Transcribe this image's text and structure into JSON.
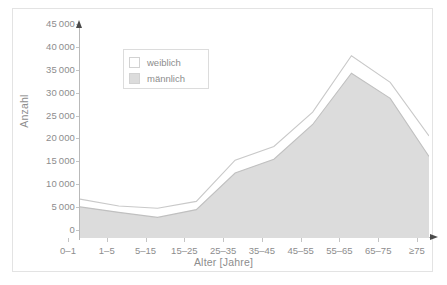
{
  "chart_data": {
    "type": "area",
    "title": "",
    "subtitle": "",
    "xlabel": "Alter [Jahre]",
    "ylabel": "Anzahl",
    "categories": [
      "0–1",
      "1–5",
      "5–15",
      "15–25",
      "25–35",
      "35–45",
      "45–55",
      "55–65",
      "65–75",
      "≥75"
    ],
    "ylim": [
      0,
      45000
    ],
    "xlim_note": "categorical, evenly spaced",
    "ytick_labels": [
      "0",
      "5 000",
      "10 000",
      "15 000",
      "20 000",
      "25 000",
      "30 000",
      "35 000",
      "40 000",
      "45 000"
    ],
    "ytick_values": [
      0,
      5000,
      10000,
      15000,
      20000,
      25000,
      30000,
      35000,
      40000,
      45000
    ],
    "grid": false,
    "stacked": true,
    "legend_position": "upper-left-inside",
    "series": [
      {
        "name": "männlich",
        "color": "#dcdcdc",
        "values": [
          6800,
          5600,
          4500,
          6200,
          14200,
          17200,
          24800,
          36000,
          30500,
          17800
        ]
      },
      {
        "name": "weiblich",
        "color": "#ffffff",
        "note": "drawn as cumulative total (männlich + weiblich)",
        "cumulative_values": [
          8500,
          7000,
          6500,
          8000,
          17000,
          20000,
          27500,
          39800,
          34000,
          22300
        ],
        "values": [
          1700,
          1400,
          2000,
          1800,
          2800,
          2800,
          2700,
          3800,
          3500,
          4500
        ]
      }
    ]
  },
  "legend": {
    "items": [
      {
        "label": "weiblich",
        "color": "#ffffff"
      },
      {
        "label": "männlich",
        "color": "#dcdcdc"
      }
    ]
  },
  "axes": {
    "y_title": "Anzahl",
    "x_title": "Alter [Jahre]"
  },
  "colors": {
    "male_fill": "#dcdcdc",
    "female_fill": "#ffffff",
    "line": "#c0c0c0",
    "axis": "#b9b9b9",
    "text": "#8d8d8d",
    "frame": "#e3e3e3",
    "background": "#ffffff"
  }
}
